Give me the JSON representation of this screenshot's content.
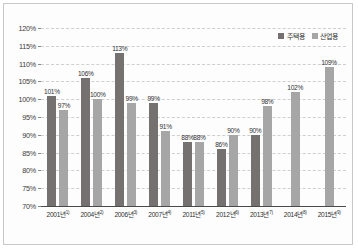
{
  "chart_data": {
    "type": "bar",
    "title": "",
    "xlabel": "",
    "ylabel": "",
    "ylim": [
      70,
      120
    ],
    "ytick_step": 5,
    "ytick_labels": [
      "120%",
      "115%",
      "110%",
      "105%",
      "100%",
      "95%",
      "90%",
      "85%",
      "80%",
      "75%",
      "70%"
    ],
    "ytick_values": [
      120,
      115,
      110,
      105,
      100,
      95,
      90,
      85,
      80,
      75,
      70
    ],
    "grid": true,
    "grid_style": "horizontal-dashed",
    "legend_position": "top-right",
    "categories": [
      "2001년1)",
      "2004년2)",
      "2006년3)",
      "2007년4)",
      "2011년5)",
      "2012년6)",
      "2013년7)",
      "2014년8)",
      "2015년9)"
    ],
    "category_labels": [
      {
        "year": "2001년",
        "note": "1)"
      },
      {
        "year": "2004년",
        "note": "2)"
      },
      {
        "year": "2006년",
        "note": "3)"
      },
      {
        "year": "2007년",
        "note": "4)"
      },
      {
        "year": "2011년",
        "note": "5)"
      },
      {
        "year": "2012년",
        "note": "6)"
      },
      {
        "year": "2013년",
        "note": "7)"
      },
      {
        "year": "2014년",
        "note": "8)"
      },
      {
        "year": "2015년",
        "note": "9)"
      }
    ],
    "series": [
      {
        "name": "주택용",
        "color": "#767171",
        "values": [
          101,
          106,
          113,
          99,
          88,
          86,
          90,
          null,
          null
        ],
        "labels": [
          "101%",
          "106%",
          "113%",
          "99%",
          "88%",
          "86%",
          "90%",
          "",
          ""
        ]
      },
      {
        "name": "산업용",
        "color": "#a6a6a6",
        "values": [
          97,
          100,
          99,
          91,
          88,
          90,
          98,
          102,
          109
        ],
        "labels": [
          "97%",
          "100%",
          "99%",
          "91%",
          "88%",
          "90%",
          "98%",
          "102%",
          "109%"
        ]
      }
    ]
  },
  "legend": {
    "items": [
      {
        "label": "주택용",
        "color": "#767171"
      },
      {
        "label": "산업용",
        "color": "#a6a6a6"
      }
    ]
  }
}
